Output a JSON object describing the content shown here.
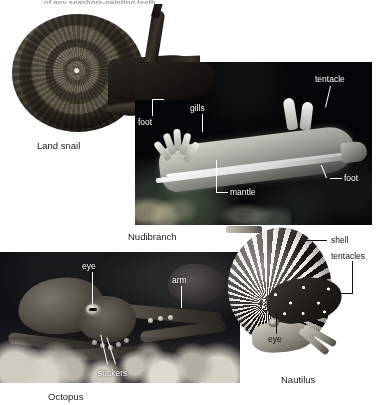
{
  "figure": {
    "top_cropped_caption": "of any seashore-painting teeth.",
    "background_color": "#ffffff",
    "width": 390,
    "height": 405
  },
  "panels": [
    {
      "id": "land-snail",
      "caption": "Land snail",
      "type": "photo-on-white",
      "labels": []
    },
    {
      "id": "nudibranch",
      "caption": "Nudibranch",
      "type": "dark-photo",
      "background_color": "#040506",
      "label_color": "#ffffff",
      "labels": [
        "foot",
        "gills",
        "tentacle",
        "foot",
        "mantle"
      ]
    },
    {
      "id": "octopus",
      "caption": "Octopus",
      "type": "dark-photo",
      "background_color": "#07070a",
      "label_color": "#ffffff",
      "labels": [
        "eye",
        "arm",
        "suckers"
      ]
    },
    {
      "id": "nautilus",
      "caption": "Nautilus",
      "type": "cutout-on-white",
      "label_color": "#111111",
      "labels": [
        "shell",
        "tentacles",
        "eye"
      ]
    }
  ],
  "nudibranch_labels": {
    "foot_left": "foot",
    "gills": "gills",
    "tentacle": "tentacle",
    "foot_right": "foot",
    "mantle": "mantle"
  },
  "octopus_labels": {
    "eye": "eye",
    "arm": "arm",
    "suckers": "suckers"
  },
  "nautilus_labels": {
    "shell": "shell",
    "tentacles": "tentacles",
    "eye": "eye"
  },
  "captions": {
    "land_snail": "Land snail",
    "nudibranch": "Nudibranch",
    "octopus": "Octopus",
    "nautilus": "Nautilus"
  }
}
